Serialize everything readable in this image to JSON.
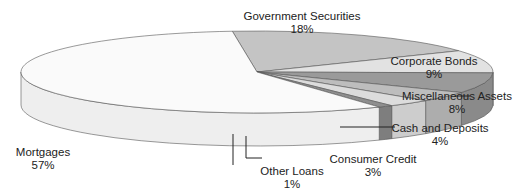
{
  "chart_data": {
    "type": "pie",
    "style": "3d-tilted",
    "title": "",
    "categories": [
      "Government Securities",
      "Corporate Bonds",
      "Miscellaneous Assets",
      "Cash and Deposits",
      "Consumer Credit",
      "Other Loans",
      "Mortgages"
    ],
    "values": [
      18,
      9,
      8,
      4,
      3,
      1,
      57
    ],
    "unit": "%",
    "colors": [
      "#c4c4c4",
      "#e2e2e2",
      "#9a9a9a",
      "#bdbdbd",
      "#dcdcdc",
      "#8e8e8e",
      "#fafafa"
    ],
    "side_colors": [
      "#b4b4b4",
      "#d2d2d2",
      "#8a8a8a",
      "#adadad",
      "#cdcdcd",
      "#7e7e7e",
      "#eeeeee"
    ],
    "labels": [
      {
        "name": "Government Securities",
        "pct": "18%",
        "x": 302,
        "y": 10
      },
      {
        "name": "Corporate Bonds",
        "pct": "9%",
        "x": 434,
        "y": 55
      },
      {
        "name": "Miscellaneous Assets",
        "pct": "8%",
        "x": 457,
        "y": 90
      },
      {
        "name": "Cash and Deposits",
        "pct": "4%",
        "x": 440,
        "y": 122
      },
      {
        "name": "Consumer Credit",
        "pct": "3%",
        "x": 373,
        "y": 153
      },
      {
        "name": "Other Loans",
        "pct": "1%",
        "x": 292,
        "y": 165
      },
      {
        "name": "Mortgages",
        "pct": "57%",
        "x": 43,
        "y": 146
      }
    ]
  }
}
